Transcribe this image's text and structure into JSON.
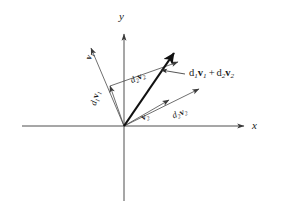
{
  "figure": {
    "background": "#ffffff",
    "ink_color": "#1a1a1a",
    "thin_line_color": "#444444",
    "size": {
      "width": 281,
      "height": 220
    }
  },
  "axes": {
    "x_label": "x",
    "y_label": "y",
    "origin": {
      "x": 124,
      "y": 126
    },
    "x_start": {
      "x": 22,
      "y": 126
    },
    "x_end": {
      "x": 248,
      "y": 126
    },
    "y_top": {
      "x": 124,
      "y": 30
    },
    "y_bottom": {
      "x": 124,
      "y": 201
    },
    "x_arrow": "right",
    "y_arrow": "up"
  },
  "vectors": [
    {
      "id": "v1",
      "name": "v-one",
      "label_parts": {
        "coef": "",
        "coef_sub": "",
        "vec": "v",
        "vec_sub": "1"
      },
      "label_plain": "v1",
      "tip": {
        "x": 90,
        "y": 46
      },
      "style": "thin",
      "label_pos": {
        "x": 88,
        "y": 56
      },
      "label_rotation": -68
    },
    {
      "id": "d1v1",
      "name": "d-one-v-one",
      "label_parts": {
        "coef": "d",
        "coef_sub": "1",
        "vec": "v",
        "vec_sub": "1"
      },
      "label_plain": "d1v1",
      "tip": {
        "x": 109,
        "y": 84
      },
      "style": "thin",
      "label_pos": {
        "x": 92,
        "y": 99
      },
      "label_rotation": -74
    },
    {
      "id": "v2",
      "name": "v-two",
      "label_parts": {
        "coef": "",
        "coef_sub": "",
        "vec": "v",
        "vec_sub": "2"
      },
      "label_plain": "v2",
      "tip": {
        "x": 171,
        "y": 98
      },
      "style": "thin",
      "label_pos": {
        "x": 141,
        "y": 111
      },
      "label_rotation": -22
    },
    {
      "id": "d2v2-lower",
      "name": "d-two-v-two-lower",
      "label_parts": {
        "coef": "d",
        "coef_sub": "2",
        "vec": "v",
        "vec_sub": "2"
      },
      "label_plain": "d2v2",
      "tip": {
        "x": 201,
        "y": 87
      },
      "style": "thin",
      "label_pos": {
        "x": 173,
        "y": 108
      },
      "label_rotation": -22
    },
    {
      "id": "d2v2-upper",
      "name": "d-two-v-two-upper",
      "label_parts": {
        "coef": "d",
        "coef_sub": "2",
        "vec": "v",
        "vec_sub": "2"
      },
      "label_plain": "d2v2",
      "tip": {
        "x": 180,
        "y": 60
      },
      "style": "thin",
      "label_pos": {
        "x": 130,
        "y": 73
      },
      "label_rotation": -26
    },
    {
      "id": "resultant",
      "name": "resultant-sum",
      "label_parts": {
        "coef": "d",
        "coef_sub": "1",
        "vec": "v",
        "vec_sub": "1"
      },
      "label_plain": "d1v1 + d2v2",
      "tip": {
        "x": 176,
        "y": 50
      },
      "style": "thick",
      "label_pos": {
        "x": 187,
        "y": 68
      }
    }
  ],
  "resultant_label": {
    "coef1": "d",
    "coef1_sub": "1",
    "vec1": "v",
    "vec1_sub": "1",
    "operator": "+",
    "coef2": "d",
    "coef2_sub": "2",
    "vec2": "v",
    "vec2_sub": "2"
  },
  "leader_line": {
    "name": "resultant-leader",
    "from": {
      "x": 184,
      "y": 74
    },
    "to": {
      "x": 160,
      "y": 70
    }
  }
}
